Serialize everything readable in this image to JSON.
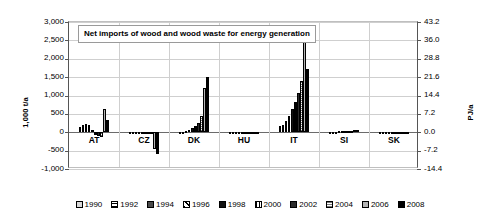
{
  "chart_data": {
    "type": "bar",
    "title": "Net imports of wood and wood waste for energy generation",
    "xlabel": "",
    "ylabel": "1,000 t/a",
    "y2label": "PJ/a",
    "ylim": [
      -1000,
      3000
    ],
    "y2lim": [
      -14.4,
      43.2
    ],
    "ytick_labels": [
      "3,000",
      "2,500",
      "2,000",
      "1,500",
      "1,000",
      "500",
      "0",
      "-500",
      "-1,000"
    ],
    "ytick_values": [
      3000,
      2500,
      2000,
      1500,
      1000,
      500,
      0,
      -500,
      -1000
    ],
    "y2tick_labels": [
      "43.2",
      "36.0",
      "28.8",
      "21.6",
      "14.4",
      "7.2",
      "0.0",
      "-7.2",
      "-14.4"
    ],
    "y2tick_values": [
      43.2,
      36.0,
      28.8,
      21.6,
      14.4,
      7.2,
      0.0,
      -7.2,
      -14.4
    ],
    "grid": true,
    "legend_position": "bottom",
    "categories": [
      "AT",
      "CZ",
      "DK",
      "HU",
      "IT",
      "SI",
      "SK"
    ],
    "series": [
      {
        "name": "1990",
        "values": [
          150,
          -10,
          15,
          -5,
          170,
          10,
          0
        ]
      },
      {
        "name": "1992",
        "values": [
          200,
          -10,
          20,
          -5,
          210,
          15,
          0
        ]
      },
      {
        "name": "1994",
        "values": [
          215,
          -15,
          30,
          -8,
          300,
          20,
          0
        ]
      },
      {
        "name": "1996",
        "values": [
          195,
          -20,
          60,
          -10,
          430,
          25,
          0
        ]
      },
      {
        "name": "1998",
        "values": [
          60,
          -25,
          105,
          -12,
          620,
          30,
          0
        ]
      },
      {
        "name": "2000",
        "values": [
          -70,
          -30,
          175,
          -15,
          830,
          35,
          0
        ]
      },
      {
        "name": "2002",
        "values": [
          -100,
          -40,
          265,
          -20,
          1080,
          40,
          0
        ]
      },
      {
        "name": "2004",
        "values": [
          -120,
          -60,
          430,
          -25,
          1400,
          45,
          0
        ]
      },
      {
        "name": "2006",
        "values": [
          640,
          -450,
          1210,
          -30,
          2650,
          50,
          0
        ]
      },
      {
        "name": "2008",
        "values": [
          330,
          -590,
          1500,
          -35,
          1720,
          55,
          0
        ]
      }
    ]
  },
  "legend": {
    "items": [
      "1990",
      "1992",
      "1994",
      "1996",
      "1998",
      "2000",
      "2002",
      "2004",
      "2006",
      "2008"
    ]
  }
}
